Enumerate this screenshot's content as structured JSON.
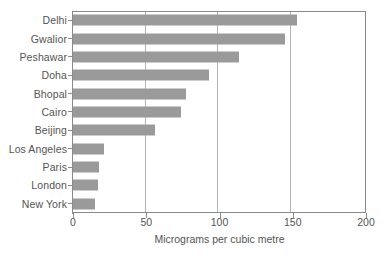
{
  "chart_data": {
    "type": "bar",
    "orientation": "horizontal",
    "title": "",
    "xlabel": "Micrograms per cubic metre",
    "ylabel": "",
    "xlim": [
      0,
      200
    ],
    "xticks": [
      0,
      50,
      100,
      150,
      200
    ],
    "xtick_labels": [
      "0",
      "50",
      "100",
      "150",
      "200"
    ],
    "grid": "vertical gridlines at 50, 100, 150",
    "legend": "none",
    "bar_color": "#9a9a9a",
    "axis_color": "#8a8a8a",
    "categories": [
      "Delhi",
      "Gwalior",
      "Peshawar",
      "Doha",
      "Bhopal",
      "Cairo",
      "Beijing",
      "Los Angeles",
      "Paris",
      "London",
      "New York"
    ],
    "values": [
      153,
      145,
      113,
      93,
      77,
      74,
      56,
      21,
      18,
      17,
      15
    ],
    "series": [
      {
        "name": "Micrograms per cubic metre",
        "values": [
          153,
          145,
          113,
          93,
          77,
          74,
          56,
          21,
          18,
          17,
          15
        ]
      }
    ]
  },
  "footnote": ""
}
